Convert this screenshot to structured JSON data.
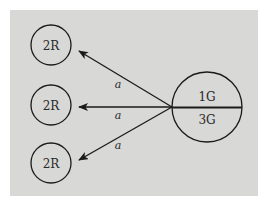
{
  "diagram": {
    "type": "directed-graph",
    "background_color": "#ffffff",
    "panel_color": "#d8d8d6",
    "stroke_color": "#1a1a1a",
    "source_node": {
      "id": "source",
      "top_label": "1G",
      "bottom_label": "3G",
      "divided": true
    },
    "target_nodes": [
      {
        "id": "target-1",
        "label": "2R"
      },
      {
        "id": "target-2",
        "label": "2R"
      },
      {
        "id": "target-3",
        "label": "2R"
      }
    ],
    "edges": [
      {
        "from": "source",
        "to": "target-1",
        "label": "a"
      },
      {
        "from": "source",
        "to": "target-2",
        "label": "a"
      },
      {
        "from": "source",
        "to": "target-3",
        "label": "a"
      }
    ]
  }
}
